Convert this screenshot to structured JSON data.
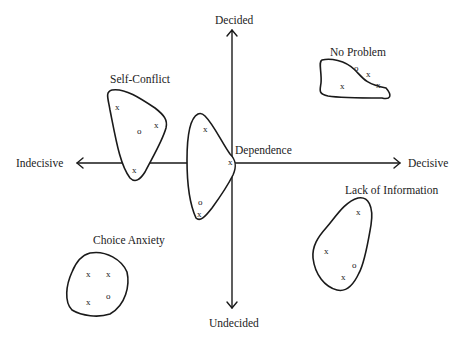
{
  "axes": {
    "top": "Decided",
    "bottom": "Undecided",
    "left": "Indecisive",
    "right": "Decisive"
  },
  "clusters": [
    {
      "name": "Self-Conflict",
      "markers": [
        "x",
        "o",
        "x",
        "x"
      ]
    },
    {
      "name": "Dependence",
      "markers": [
        "x",
        "x",
        "o",
        "x"
      ]
    },
    {
      "name": "No Problem",
      "markers": [
        "o",
        "x",
        "x",
        "x"
      ]
    },
    {
      "name": "Choice Anxiety",
      "markers": [
        "x",
        "x",
        "x",
        "o"
      ]
    },
    {
      "name": "Lack of Information",
      "markers": [
        "x",
        "x",
        "o",
        "x"
      ]
    }
  ],
  "colors": {
    "line": "#1a1a1a",
    "background": "#ffffff"
  }
}
